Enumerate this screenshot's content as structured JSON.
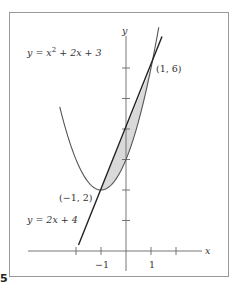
{
  "figure": {
    "label_number": "5",
    "frame_color": "#999999",
    "shade_color": "#d9d9d9"
  },
  "axes": {
    "x_label": "x",
    "y_label": "y",
    "x_tick_labels": [
      {
        "value": -1,
        "text": "−1"
      },
      {
        "value": 1,
        "text": "1"
      }
    ],
    "x_ticks": [
      -2,
      -1,
      1,
      2
    ],
    "y_ticks": [
      1,
      2,
      3,
      4,
      5,
      6
    ]
  },
  "curves": {
    "parabola": {
      "equation_text": "y = x² + 2x + 3",
      "equation_prefix": "y = x",
      "equation_exp": "2",
      "equation_suffix": " + 2x + 3"
    },
    "line": {
      "equation_text": "y = 2x + 4"
    }
  },
  "points": [
    {
      "name": "intersection-right",
      "text": "(1, 6)",
      "x": 1,
      "y": 6
    },
    {
      "name": "intersection-left",
      "text": "(−1, 2)",
      "x": -1,
      "y": 2
    }
  ],
  "chart_data": {
    "type": "line",
    "title": "",
    "xlabel": "x",
    "ylabel": "y",
    "xlim": [
      -2.3,
      3.3
    ],
    "ylim": [
      -0.6,
      7.4
    ],
    "grid": false,
    "series": [
      {
        "name": "y = x^2 + 2x + 3",
        "x": [
          -2.7,
          -2,
          -1.5,
          -1,
          -0.5,
          0,
          0.5,
          1,
          1.3
        ],
        "y": [
          4.89,
          3,
          2.25,
          2,
          2.25,
          3,
          4.25,
          6,
          7.29
        ]
      },
      {
        "name": "y = 2x + 4",
        "x": [
          -1.9,
          1.45
        ],
        "y": [
          0.2,
          6.9
        ]
      }
    ],
    "shaded_region": {
      "between": [
        "y = 2x + 4",
        "y = x^2 + 2x + 3"
      ],
      "x_range": [
        -1,
        1
      ]
    },
    "annotations": [
      {
        "text": "(1, 6)",
        "x": 1,
        "y": 6
      },
      {
        "text": "(−1, 2)",
        "x": -1,
        "y": 2
      }
    ]
  }
}
